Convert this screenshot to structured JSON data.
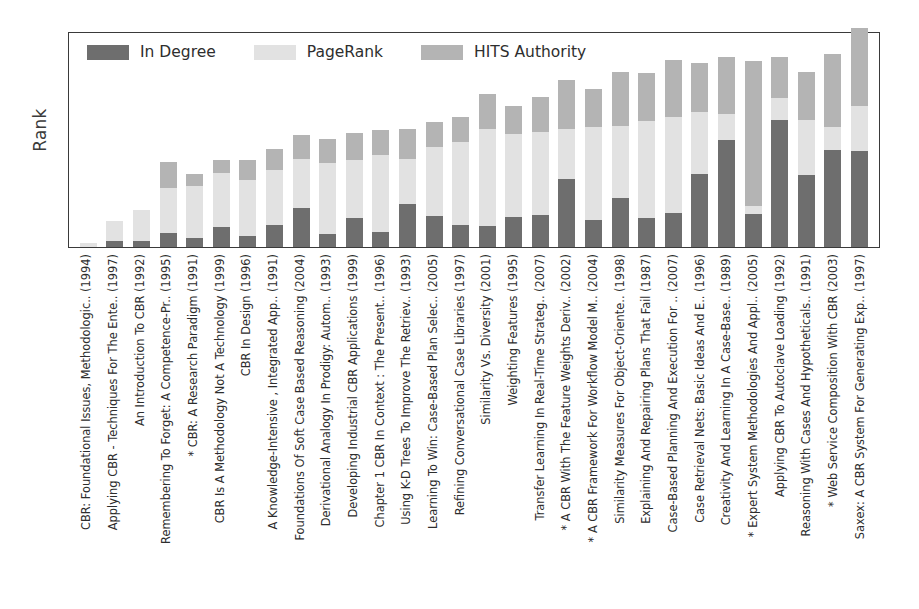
{
  "axis": {
    "ylabel": "Rank"
  },
  "legend": {
    "items": [
      {
        "label": "In Degree",
        "color": "#6e6e6e"
      },
      {
        "label": "PageRank",
        "color": "#e2e2e2"
      },
      {
        "label": "HITS Authority",
        "color": "#b4b4b4"
      }
    ]
  },
  "chart_data": {
    "type": "bar",
    "title": "",
    "xlabel": "",
    "ylabel": "Rank",
    "stacked": true,
    "grid": false,
    "legend_position": "top-left",
    "ylim": [
      0,
      216
    ],
    "categories": [
      "CBR: Foundational Issues, Methodologic.. (1994)",
      "Applying CBR - Techniques For The Ente.. (1997)",
      "An Introduction To CBR (1992)",
      "Remembering To Forget: A Competence-Pr.. (1995)",
      "* CBR: A Research Paradigm (1991)",
      "CBR Is A Methodology Not A Technology (1999)",
      "CBR In Design (1996)",
      "A Knowledge-Intensive , Integrated App.. (1991)",
      "Foundations Of Soft Case Based Reasoning (2004)",
      "Derivational Analogy In Prodigy: Autom.. (1993)",
      "Developing Industrial CBR Applications (1999)",
      "Chapter 1 CBR In Context : The Present.. (1996)",
      "Using K-D Trees To Improve The Retriev.. (1993)",
      "Learning To Win: Case-Based Plan Selec.. (2005)",
      "Refining Conversational Case Libraries (1997)",
      "Similarity Vs. Diversity (2001)",
      "Weighting Features (1995)",
      "Transfer Learning In Real-Time Strateg.. (2007)",
      "* A CBR With The Feature Weights Deriv.. (2002)",
      "* A CBR Framework For Workflow Model M.. (2004)",
      "Similarity Measures For Object-Oriente.. (1998)",
      "Explaining And Repairing Plans That Fail (1987)",
      "Case-Based Planning And Execution For .. (2007)",
      "Case Retrieval Nets: Basic Ideas And E.. (1996)",
      "Creativity And Learning In A Case-Base.. (1989)",
      "* Expert System Methodologies And Appl.. (2005)",
      "Applying CBR To Autoclave Loading (1992)",
      "Reasoning With Cases And Hypotheticals.. (1991)",
      "* Web Service Composition With CBR (2003)",
      "Saxex: A CBR System For Generating Exp.. (1997)"
    ],
    "series": [
      {
        "name": "In Degree",
        "color": "#6e6e6e",
        "values": [
          0,
          6,
          6,
          14,
          9,
          20,
          11,
          22,
          39,
          13,
          29,
          15,
          43,
          31,
          22,
          21,
          30,
          32,
          68,
          27,
          49,
          29,
          34,
          73,
          107,
          33,
          127,
          72,
          97,
          96
        ]
      },
      {
        "name": "PageRank",
        "color": "#e2e2e2",
        "values": [
          4,
          20,
          31,
          45,
          52,
          54,
          56,
          55,
          49,
          71,
          58,
          77,
          45,
          69,
          83,
          97,
          83,
          83,
          50,
          93,
          72,
          97,
          96,
          62,
          26,
          8,
          22,
          55,
          23,
          45
        ]
      },
      {
        "name": "HITS Authority",
        "color": "#b4b4b4",
        "values": [
          0,
          0,
          0,
          26,
          12,
          13,
          20,
          21,
          24,
          24,
          27,
          25,
          30,
          25,
          25,
          35,
          28,
          35,
          49,
          38,
          54,
          48,
          57,
          49,
          57,
          145,
          41,
          48,
          73,
          78
        ]
      }
    ]
  }
}
